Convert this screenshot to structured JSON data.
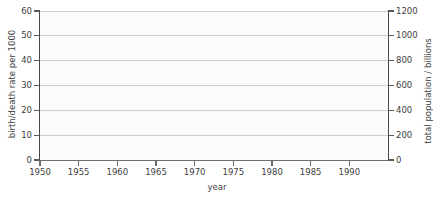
{
  "chart_data": {
    "type": "line",
    "title": "",
    "xlabel": "year",
    "ylabel": "birth/death rate per 1000",
    "y2label": "total population / billions",
    "xlim": [
      1950,
      1995
    ],
    "ylim": [
      0,
      60
    ],
    "y2lim": [
      0,
      1200
    ],
    "x_ticks": [
      1950,
      1955,
      1960,
      1965,
      1970,
      1975,
      1980,
      1985,
      1990
    ],
    "x_tick_labels": [
      "1950",
      "1955",
      "1960",
      "1965",
      "1970",
      "1975",
      "1980",
      "1985",
      "1990"
    ],
    "y_ticks": [
      0,
      10,
      20,
      30,
      40,
      50,
      60
    ],
    "y_tick_labels": [
      "0",
      "10",
      "20",
      "30",
      "40",
      "50",
      "60"
    ],
    "y2_ticks": [
      0,
      200,
      400,
      600,
      800,
      1000,
      1200
    ],
    "y2_tick_labels": [
      "0",
      "200",
      "400",
      "600",
      "800",
      "1000",
      "1200"
    ],
    "grid": "horizontal",
    "legend": null,
    "series": [],
    "values": [],
    "categories": [],
    "annotations": [],
    "note": "blank plot frame, no data series drawn"
  },
  "axes": {
    "left_title": "birth/death rate per 1000",
    "right_title": "total population / billions",
    "bottom_title": "year"
  },
  "style": {
    "axis_color": "#4a4a4a",
    "grid_color": "#cdcdcd",
    "text_color": "#3d3d3d",
    "plot_background": "#fbfbfb",
    "page_background": "#ffffff"
  },
  "top_caption_remnant": "population"
}
